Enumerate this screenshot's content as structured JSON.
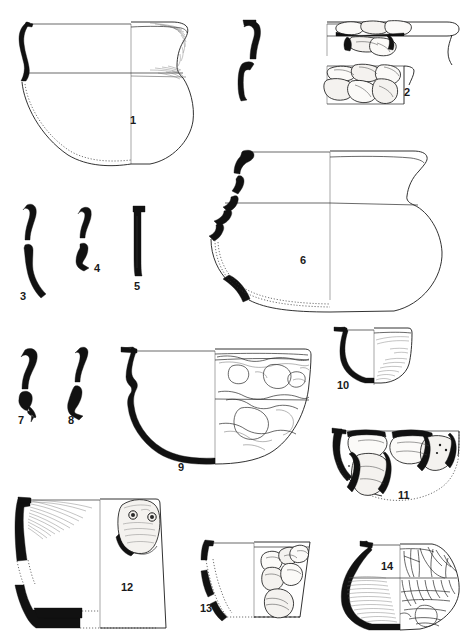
{
  "plate": {
    "title": "Archaeological pottery profile plate",
    "description": "Line-drawn archaeological illustration plate of fourteen numbered ceramic vessel profiles and rim sherds, drawn in half-section with solid black preserved-sherd indications, dotted reconstruction lines and hatched surface shading.",
    "background_color": "#ffffff",
    "ink_color": "#1b1b1b",
    "solid_fill_color": "#111111",
    "figure_count": 14,
    "width": 471,
    "height": 639
  },
  "figures": [
    {
      "number": "1",
      "label": "1",
      "label_x": 130,
      "label_y": 124,
      "type": "closed-form-jar",
      "description": "Large round-bodied jar with everted rim shown in half section; left profile solid black at rim, dotted reconstruction along lower left; right exterior with shaded rim band and carination line.",
      "region": {
        "x": 14,
        "y": 14,
        "w": 190,
        "h": 160
      }
    },
    {
      "number": "2",
      "label": "2",
      "label_x": 404,
      "label_y": 96,
      "type": "rim-sherd-detail",
      "description": "Two stacked rim detail drawings showing applied coarse temper / pebble inclusions beneath the rim, with vertical section line at right.",
      "region": {
        "x": 325,
        "y": 18,
        "w": 135,
        "h": 95
      }
    },
    {
      "number": "3",
      "label": "3",
      "label_x": 20,
      "label_y": 300,
      "type": "rim-profile-sherd",
      "description": "Tall sinuous solid-black rim and wall profile fragment with a break gap near the middle.",
      "region": {
        "x": 14,
        "y": 204,
        "w": 36,
        "h": 90
      }
    },
    {
      "number": "4",
      "label": "4",
      "label_x": 94,
      "label_y": 272,
      "type": "rim-profile-sherd",
      "description": "Short solid-black everted rim profile fragment with break gap.",
      "region": {
        "x": 74,
        "y": 207,
        "w": 26,
        "h": 58
      }
    },
    {
      "number": "5",
      "label": "5",
      "label_x": 134,
      "label_y": 290,
      "type": "rim-profile-sherd",
      "description": "Straight vertical solid-black rim profile fragment with flattened lip.",
      "region": {
        "x": 130,
        "y": 205,
        "w": 16,
        "h": 72
      }
    },
    {
      "number": "6",
      "label": "6",
      "label_x": 300,
      "label_y": 264,
      "type": "wide-bowl-jar",
      "description": "Wide carinated bowl with short everted rim; left profile rendered in broken solid-black segments with dotted reconstruction of the base, right exterior plain.",
      "region": {
        "x": 208,
        "y": 145,
        "w": 250,
        "h": 165
      }
    },
    {
      "number": "7",
      "label": "7",
      "label_x": 18,
      "label_y": 424,
      "type": "rim-profile-sherd",
      "description": "Solid-black S-curved rim and wall profile fragment.",
      "region": {
        "x": 18,
        "y": 348,
        "w": 30,
        "h": 68
      }
    },
    {
      "number": "8",
      "label": "8",
      "label_x": 68,
      "label_y": 424,
      "type": "rim-profile-sherd",
      "description": "Solid-black narrow rim profile fragment with break gap and thickened foot.",
      "region": {
        "x": 66,
        "y": 347,
        "w": 22,
        "h": 70
      }
    },
    {
      "number": "9",
      "label": "9",
      "label_x": 178,
      "label_y": 471,
      "type": "hemispherical-bowl",
      "description": "Deep hemispherical bowl; left half drawn as a thick continuous solid-black profile, right half showing exterior surface with irregular coarse inclusion / spall patterning and a horizontal mid band.",
      "region": {
        "x": 110,
        "y": 338,
        "w": 200,
        "h": 130
      }
    },
    {
      "number": "10",
      "label": "10",
      "label_x": 339,
      "label_y": 389,
      "type": "small-bowl",
      "description": "Small deep cup or bowl; left profile solid black, right half with fine diagonal hatching indicating burnish or slip.",
      "region": {
        "x": 330,
        "y": 327,
        "w": 80,
        "h": 60
      }
    },
    {
      "number": "11",
      "label": "11",
      "label_x": 398,
      "label_y": 499,
      "type": "shallow-bowl",
      "description": "Shallow open bowl with dotted reconstructed base; exterior covered with large outlined sherd fragments and dark break edges.",
      "region": {
        "x": 327,
        "y": 428,
        "w": 140,
        "h": 75
      }
    },
    {
      "number": "12",
      "label": "12",
      "label_x": 121,
      "label_y": 591,
      "type": "flaring-beaker",
      "description": "Tall flaring-walled beaker or bucket; left profile solid black with dotted reconstruction, hatched shading below the rim and an applied oval lug with two punched impressions on the right exterior.",
      "region": {
        "x": 14,
        "y": 497,
        "w": 165,
        "h": 135
      }
    },
    {
      "number": "13",
      "label": "13",
      "label_x": 200,
      "label_y": 612,
      "type": "small-cup",
      "description": "Small flaring cup with broken solid-black left profile and dotted reconstruction; right exterior shows several outlined applied or impressed sherd motifs.",
      "region": {
        "x": 196,
        "y": 535,
        "w": 115,
        "h": 85
      }
    },
    {
      "number": "14",
      "label": "14",
      "label_x": 381,
      "label_y": 570,
      "type": "carinated-bowl",
      "description": "Rounded carinated bowl; left half solid-black rim with dense horizontal hatching, right half decorated with incised arcs, lattice and vertical panel motifs.",
      "region": {
        "x": 336,
        "y": 533,
        "w": 126,
        "h": 98
      }
    }
  ]
}
